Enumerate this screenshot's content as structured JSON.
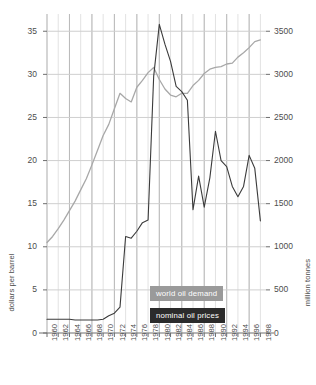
{
  "chart_data": {
    "type": "line",
    "title": "",
    "subtitle": "",
    "xlabel": "",
    "ylabel": "dollars per barrel",
    "y2label": "million tonnes",
    "grid": true,
    "legend_position": "inside-bottom-center",
    "xlim": [
      1960,
      1999
    ],
    "ylim": [
      0,
      37
    ],
    "y2lim": [
      0,
      3700
    ],
    "xticks": [
      1960,
      1962,
      1964,
      1966,
      1968,
      1970,
      1972,
      1974,
      1976,
      1978,
      1980,
      1982,
      1984,
      1986,
      1988,
      1990,
      1992,
      1994,
      1996,
      1998
    ],
    "xtick_labels": [
      "1960",
      "1962",
      "1964",
      "1966",
      "1968",
      "1970",
      "1972",
      "1974",
      "1976",
      "1978",
      "1980",
      "1982",
      "1984",
      "1986",
      "1988",
      "1990",
      "1992",
      "1994",
      "1996",
      "1998"
    ],
    "yticks": [
      0,
      5,
      10,
      15,
      20,
      25,
      30,
      35
    ],
    "ytick_labels": [
      "0",
      "5",
      "10",
      "15",
      "20",
      "25",
      "30",
      "35"
    ],
    "y2ticks": [
      0,
      500,
      1000,
      1500,
      2000,
      2500,
      3000,
      3500
    ],
    "y2tick_labels": [
      "0",
      "500",
      "1000",
      "1500",
      "2000",
      "2500",
      "3000",
      "3500"
    ],
    "series": [
      {
        "name": "world oil demand",
        "axis": "right",
        "unit": "million tonnes",
        "color": "#a8a8a8",
        "x": [
          1960,
          1961,
          1962,
          1963,
          1964,
          1965,
          1966,
          1967,
          1968,
          1969,
          1970,
          1971,
          1972,
          1973,
          1974,
          1975,
          1976,
          1977,
          1978,
          1979,
          1980,
          1981,
          1982,
          1983,
          1984,
          1985,
          1986,
          1987,
          1988,
          1989,
          1990,
          1991,
          1992,
          1993,
          1994,
          1995,
          1996,
          1997,
          1998
        ],
        "values": [
          1050,
          1120,
          1210,
          1310,
          1420,
          1530,
          1660,
          1790,
          1950,
          2120,
          2290,
          2420,
          2600,
          2780,
          2720,
          2680,
          2850,
          2930,
          3020,
          3080,
          2940,
          2830,
          2760,
          2740,
          2780,
          2780,
          2870,
          2930,
          3010,
          3060,
          3080,
          3090,
          3120,
          3130,
          3200,
          3250,
          3310,
          3380,
          3400
        ]
      },
      {
        "name": "nominal oil prices",
        "axis": "left",
        "unit": "dollars per barrel",
        "color": "#3b3b3b",
        "x": [
          1960,
          1961,
          1962,
          1963,
          1964,
          1965,
          1966,
          1967,
          1968,
          1969,
          1970,
          1971,
          1972,
          1973,
          1974,
          1975,
          1976,
          1977,
          1978,
          1979,
          1980,
          1981,
          1982,
          1983,
          1984,
          1985,
          1986,
          1987,
          1988,
          1989,
          1990,
          1991,
          1992,
          1993,
          1994,
          1995,
          1996,
          1997,
          1998
        ],
        "values": [
          1.6,
          1.6,
          1.6,
          1.6,
          1.6,
          1.5,
          1.5,
          1.5,
          1.5,
          1.5,
          1.6,
          2.0,
          2.3,
          3.0,
          11.2,
          11.0,
          11.8,
          12.8,
          13.1,
          29.8,
          35.8,
          33.5,
          31.5,
          28.6,
          28.0,
          27.0,
          14.3,
          18.2,
          14.6,
          18.0,
          23.4,
          20.0,
          19.3,
          17.0,
          15.8,
          17.0,
          20.6,
          19.1,
          13.0
        ]
      }
    ],
    "legend": [
      {
        "label": "world oil demand",
        "color": "#9a9a9a"
      },
      {
        "label": "nominal oil prices",
        "color": "#2b2b2b"
      }
    ],
    "annotations": []
  },
  "colors": {
    "demand_line": "#a8a8a8",
    "price_line": "#3b3b3b",
    "grid_major": "#b9b9b9",
    "grid_minor": "#e2e2e2",
    "grid_horizontal": "#cfcfcf",
    "axis": "#6e6e6e",
    "legend_demand_bg": "#9a9a9a",
    "legend_prices_bg": "#2b2b2b",
    "text": "#4d4d4d",
    "background": "#ffffff"
  }
}
